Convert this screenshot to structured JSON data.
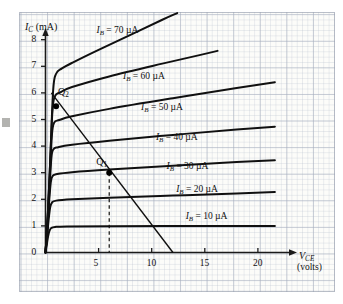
{
  "figure": {
    "name": "transistor-collector-characteristics",
    "background_color": "#ffffff",
    "grid_major_color": "#96a0b4",
    "grid_minor_color": "#aab4c6",
    "ink_color": "#101010"
  },
  "axes": {
    "y_title_symbol": "I",
    "y_title_sub": "C",
    "y_title_unit": "(mA)",
    "x_title_symbol": "V",
    "x_title_sub": "CE",
    "x_title_unit": "(volts)",
    "y_ticks": [
      "0",
      "1",
      "2",
      "3",
      "4",
      "5",
      "6",
      "7",
      "8"
    ],
    "x_ticks": [
      "5",
      "10",
      "15",
      "20"
    ]
  },
  "curve_labels": [
    {
      "prefix": "I",
      "sub": "B",
      "eq": "= 70",
      "unit": "µA"
    },
    {
      "prefix": "I",
      "sub": "B",
      "eq": "= 60",
      "unit": "µA"
    },
    {
      "prefix": "I",
      "sub": "B",
      "eq": "= 50",
      "unit": "µA"
    },
    {
      "prefix": "I",
      "sub": "B",
      "eq": "= 40",
      "unit": "µA"
    },
    {
      "prefix": "I",
      "sub": "B",
      "eq": "= 30",
      "unit": "µA"
    },
    {
      "prefix": "I",
      "sub": "B",
      "eq": "= 20",
      "unit": "µA"
    },
    {
      "prefix": "I",
      "sub": "B",
      "eq": "= 10",
      "unit": "µA"
    }
  ],
  "operating_points": [
    {
      "name": "Q",
      "sub": "2",
      "vce": 1.0,
      "ic": 5.5
    },
    {
      "name": "Q",
      "sub": "1",
      "vce": 6.0,
      "ic": 3.0
    }
  ],
  "chart_data": {
    "type": "line",
    "title": "",
    "xlabel": "V_CE (volts)",
    "ylabel": "I_C (mA)",
    "xlim": [
      0,
      23.5
    ],
    "ylim": [
      0,
      9.3
    ],
    "xticks": [
      5,
      10,
      15,
      20
    ],
    "yticks": [
      0,
      1,
      2,
      3,
      4,
      5,
      6,
      7,
      8
    ],
    "grid": true,
    "legend": "inline-labels",
    "series": [
      {
        "name": "I_B = 10 µA",
        "label_x": 13.2,
        "label_y": 1.52,
        "knee_v": 0.45,
        "points": [
          [
            0,
            0
          ],
          [
            0.12,
            0.3
          ],
          [
            0.25,
            0.62
          ],
          [
            0.38,
            0.82
          ],
          [
            0.55,
            0.92
          ],
          [
            0.9,
            0.96
          ],
          [
            2,
            0.98
          ],
          [
            6,
            0.99
          ],
          [
            12,
            1.0
          ],
          [
            18,
            1.0
          ],
          [
            21.6,
            1.0
          ]
        ]
      },
      {
        "name": "I_B = 20 µA",
        "label_x": 12.3,
        "label_y": 2.52,
        "knee_v": 0.5,
        "points": [
          [
            0,
            0
          ],
          [
            0.14,
            0.55
          ],
          [
            0.3,
            1.25
          ],
          [
            0.45,
            1.72
          ],
          [
            0.62,
            1.88
          ],
          [
            1.0,
            1.95
          ],
          [
            2.5,
            2.0
          ],
          [
            6,
            2.06
          ],
          [
            12,
            2.14
          ],
          [
            18,
            2.22
          ],
          [
            21.6,
            2.27
          ]
        ]
      },
      {
        "name": "I_B = 30 µA",
        "label_x": 11.4,
        "label_y": 3.42,
        "knee_v": 0.55,
        "points": [
          [
            0,
            0
          ],
          [
            0.15,
            0.7
          ],
          [
            0.32,
            1.8
          ],
          [
            0.5,
            2.65
          ],
          [
            0.68,
            2.88
          ],
          [
            1.1,
            2.95
          ],
          [
            2.5,
            3.02
          ],
          [
            6,
            3.12
          ],
          [
            12,
            3.26
          ],
          [
            18,
            3.4
          ],
          [
            21.6,
            3.47
          ]
        ]
      },
      {
        "name": "I_B = 40 µA",
        "label_x": 10.4,
        "label_y": 4.48,
        "knee_v": 0.6,
        "points": [
          [
            0,
            0
          ],
          [
            0.16,
            0.85
          ],
          [
            0.35,
            2.2
          ],
          [
            0.55,
            3.55
          ],
          [
            0.75,
            3.88
          ],
          [
            1.2,
            3.96
          ],
          [
            2.5,
            4.05
          ],
          [
            6,
            4.2
          ],
          [
            12,
            4.42
          ],
          [
            18,
            4.62
          ],
          [
            21.6,
            4.73
          ]
        ]
      },
      {
        "name": "I_B = 50 µA",
        "label_x": 9.0,
        "label_y": 5.62,
        "knee_v": 0.65,
        "points": [
          [
            0,
            0
          ],
          [
            0.17,
            1.0
          ],
          [
            0.38,
            2.6
          ],
          [
            0.6,
            4.4
          ],
          [
            0.82,
            4.88
          ],
          [
            1.3,
            4.98
          ],
          [
            2.5,
            5.12
          ],
          [
            6,
            5.4
          ],
          [
            12,
            5.8
          ],
          [
            18,
            6.18
          ],
          [
            21.6,
            6.4
          ]
        ]
      },
      {
        "name": "I_B = 60 µA",
        "label_x": 7.3,
        "label_y": 6.8,
        "knee_v": 0.7,
        "points": [
          [
            0,
            0
          ],
          [
            0.18,
            1.1
          ],
          [
            0.4,
            3.0
          ],
          [
            0.65,
            5.3
          ],
          [
            0.9,
            5.88
          ],
          [
            1.4,
            6.02
          ],
          [
            2.5,
            6.22
          ],
          [
            6,
            6.62
          ],
          [
            11,
            7.1
          ],
          [
            14.5,
            7.42
          ],
          [
            16.2,
            7.58
          ]
        ]
      },
      {
        "name": "I_B = 70 µA",
        "label_x": 4.8,
        "label_y": 8.52,
        "knee_v": 0.75,
        "points": [
          [
            0,
            0
          ],
          [
            0.2,
            1.25
          ],
          [
            0.45,
            3.5
          ],
          [
            0.72,
            6.1
          ],
          [
            1.0,
            6.72
          ],
          [
            1.55,
            6.92
          ],
          [
            2.6,
            7.15
          ],
          [
            5,
            7.62
          ],
          [
            8,
            8.18
          ],
          [
            11,
            8.75
          ],
          [
            12.4,
            9.0
          ]
        ]
      }
    ],
    "load_line": {
      "name": "DC load line",
      "from": [
        0.55,
        6.0
      ],
      "to": [
        12.0,
        0.0
      ],
      "x_intercept": 12.0,
      "y_intercept_approx": 6.3
    },
    "annotations": [
      {
        "text": "Q2",
        "x": 1.0,
        "y": 5.5,
        "marker": "filled-circle"
      },
      {
        "text": "Q1",
        "x": 6.0,
        "y": 3.0,
        "marker": "filled-circle"
      }
    ],
    "dashed_guides": [
      {
        "from": [
          6.0,
          3.0
        ],
        "to": [
          6.0,
          0.0
        ]
      }
    ]
  }
}
